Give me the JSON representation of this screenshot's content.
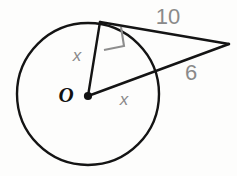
{
  "figure": {
    "background_color": "#fdfdfc",
    "stroke_color": "#141414",
    "label_color": "#8a8a8a",
    "center_label_color": "#111111"
  },
  "labels": {
    "center": "O",
    "radius_upper": "x",
    "radius_lower": "x",
    "tangent_length": "10",
    "external_segment": "6"
  },
  "geometry": {
    "circle": {
      "cx": 88,
      "cy": 94,
      "r": 73
    },
    "center_point": {
      "x": 88,
      "y": 96
    },
    "tangent_point": {
      "x": 100,
      "y": 22
    },
    "external_point": {
      "x": 229,
      "y": 44
    },
    "secant_entry_point": {
      "x": 152,
      "y": 70
    },
    "right_angle_marker": {
      "x": 101,
      "y": 28,
      "size": 21
    }
  },
  "label_positions": {
    "center": {
      "x": 66,
      "y": 101
    },
    "radius_upper": {
      "x": 76,
      "y": 60
    },
    "radius_lower": {
      "x": 123,
      "y": 104
    },
    "tangent_length": {
      "x": 156,
      "y": 24
    },
    "external_segment": {
      "x": 183,
      "y": 80
    }
  }
}
